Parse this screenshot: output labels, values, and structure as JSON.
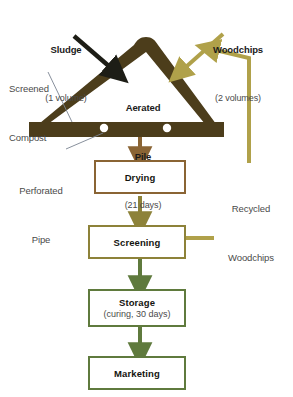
{
  "diagram": {
    "colors": {
      "pile_brown": "#4c3d1b",
      "drying_brown": "#8a6434",
      "screening_olive": "#8d8239",
      "storage_green": "#5f7a3d",
      "marketing_green": "#5f7a3d",
      "woodchip_khaki": "#b0a14a",
      "sludge_black": "#1d1d16",
      "leader_gray": "#7b8391",
      "text_dark": "#1a1a1a",
      "text_gray": "#4a4a4a"
    },
    "inputs": [
      {
        "id": "sludge",
        "label": "Sludge",
        "sublabel": "(1 volume)",
        "arrow_color": "#1d1d16"
      },
      {
        "id": "woodchips",
        "label": "Woodchips",
        "sublabel": "(2 volumes)",
        "arrow_color": "#b0a14a"
      }
    ],
    "callouts": [
      {
        "id": "screened-compost",
        "line1": "Screened",
        "line2": "Compost"
      },
      {
        "id": "perforated-pipe",
        "line1": "Perforated",
        "line2": "Pipe"
      },
      {
        "id": "recycled-woodchips",
        "line1": "Recycled",
        "line2": "Woodchips"
      }
    ],
    "pile": {
      "label": "Aerated",
      "label2": "Pile",
      "sublabel": "(21 days)",
      "perforations": 2
    },
    "steps": [
      {
        "id": "drying",
        "label": "Drying",
        "sublabel": "",
        "border_color": "#8a6434"
      },
      {
        "id": "screening",
        "label": "Screening",
        "sublabel": "",
        "border_color": "#8d8239"
      },
      {
        "id": "storage",
        "label": "Storage",
        "sublabel": "(curing, 30 days)",
        "border_color": "#5f7a3d"
      },
      {
        "id": "marketing",
        "label": "Marketing",
        "sublabel": "",
        "border_color": "#5f7a3d"
      }
    ]
  }
}
